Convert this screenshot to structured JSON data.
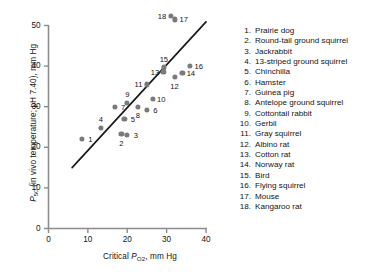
{
  "chart_data": {
    "type": "scatter",
    "title": "",
    "xlabel": "Critical P_O2, mm Hg",
    "ylabel": "P_50 (in vivo temperature; pH 7.40), mm Hg",
    "xlim": [
      0,
      40
    ],
    "ylim": [
      0,
      50
    ],
    "xticks": [
      0,
      10,
      20,
      30,
      40
    ],
    "yticks": [
      0,
      10,
      20,
      30,
      40,
      50
    ],
    "grid": false,
    "legend_position": "right",
    "x": [
      8.5,
      18.5,
      20.0,
      13.3,
      19.3,
      25.0,
      16.8,
      22.7,
      20.0,
      26.5,
      25.0,
      32.0,
      29.2,
      34.0,
      29.3,
      36.0,
      32.2,
      31.0
    ],
    "y": [
      22.0,
      23.2,
      23.0,
      24.8,
      27.0,
      29.2,
      30.0,
      30.0,
      31.0,
      32.0,
      35.5,
      37.3,
      38.5,
      38.3,
      39.7,
      40.0,
      51.5,
      52.4
    ],
    "point_labels": [
      "1",
      "2",
      "3",
      "4",
      "5",
      "6",
      "7",
      "8",
      "9",
      "10",
      "11",
      "12",
      "13",
      "14",
      "15",
      "16",
      "17",
      "18"
    ],
    "series": [
      {
        "name": "species",
        "points": [
          {
            "id": 1,
            "label": "Prairie dog",
            "x": 8.5,
            "y": 22.0,
            "label_pos": "right"
          },
          {
            "id": 2,
            "label": "Round-tail ground squirrel",
            "x": 18.5,
            "y": 23.2,
            "label_pos": "below"
          },
          {
            "id": 3,
            "label": "Jackrabbit",
            "x": 20.0,
            "y": 23.0,
            "label_pos": "right"
          },
          {
            "id": 4,
            "label": "13-striped ground squirrel",
            "x": 13.3,
            "y": 24.8,
            "label_pos": "above"
          },
          {
            "id": 5,
            "label": "Chinchilla",
            "x": 19.3,
            "y": 27.0,
            "label_pos": "right"
          },
          {
            "id": 6,
            "label": "Hamster",
            "x": 25.0,
            "y": 29.2,
            "label_pos": "right"
          },
          {
            "id": 7,
            "label": "Guinea pig",
            "x": 16.8,
            "y": 30.0,
            "label_pos": "right"
          },
          {
            "id": 8,
            "label": "Antelope ground squirrel",
            "x": 22.7,
            "y": 30.0,
            "label_pos": "below"
          },
          {
            "id": 9,
            "label": "Cottontail rabbit",
            "x": 20.0,
            "y": 31.0,
            "label_pos": "above"
          },
          {
            "id": 10,
            "label": "Gerbil",
            "x": 26.5,
            "y": 32.0,
            "label_pos": "right"
          },
          {
            "id": 11,
            "label": "Gray squirrel",
            "x": 25.0,
            "y": 35.5,
            "label_pos": "left"
          },
          {
            "id": 12,
            "label": "Albino rat",
            "x": 32.0,
            "y": 37.3,
            "label_pos": "below"
          },
          {
            "id": 13,
            "label": "Cotton rat",
            "x": 29.2,
            "y": 38.5,
            "label_pos": "left"
          },
          {
            "id": 14,
            "label": "Norway rat",
            "x": 34.0,
            "y": 38.3,
            "label_pos": "right"
          },
          {
            "id": 15,
            "label": "Bird",
            "x": 29.3,
            "y": 39.7,
            "label_pos": "above"
          },
          {
            "id": 16,
            "label": "Flying squirrel",
            "x": 36.0,
            "y": 40.0,
            "label_pos": "right"
          },
          {
            "id": 17,
            "label": "Mouse",
            "x": 32.2,
            "y": 51.5,
            "label_pos": "right"
          },
          {
            "id": 18,
            "label": "Kangaroo rat",
            "x": 31.0,
            "y": 52.4,
            "label_pos": "left"
          }
        ]
      }
    ],
    "trendline": {
      "x0": 6.0,
      "y0": 15.0,
      "x1": 40.0,
      "y1": 50.9
    },
    "marker_color": "#7a7a7a",
    "line_color": "#1a1a1a",
    "axis_color": "#8c8c8c"
  },
  "axes": {
    "x_title_main": "Critical ",
    "x_title_sym": "P",
    "x_title_sub": "O",
    "x_title_sub2": "2",
    "x_title_tail": ", mm Hg",
    "y_title_sym": "P",
    "y_title_sub": "50",
    "y_title_tail": " (in vivo temperature; pH 7.40), mm Hg",
    "xtick_labels": [
      "0",
      "10",
      "20",
      "30",
      "40"
    ],
    "ytick_labels": [
      "0",
      "10",
      "20",
      "30",
      "40",
      "50"
    ]
  },
  "legend": {
    "items": [
      {
        "num": "1.",
        "name": "Prairie dog"
      },
      {
        "num": "2.",
        "name": "Round-tail ground squirrel"
      },
      {
        "num": "3.",
        "name": "Jackrabbit"
      },
      {
        "num": "4.",
        "name": "13-striped ground squirrel"
      },
      {
        "num": "5.",
        "name": "Chinchilla"
      },
      {
        "num": "6.",
        "name": "Hamster"
      },
      {
        "num": "7.",
        "name": "Guinea pig"
      },
      {
        "num": "8.",
        "name": "Antelope ground squirrel"
      },
      {
        "num": "9.",
        "name": "Cottontail rabbit"
      },
      {
        "num": "10.",
        "name": "Gerbil"
      },
      {
        "num": "11.",
        "name": "Gray squirrel"
      },
      {
        "num": "12.",
        "name": "Albino rat"
      },
      {
        "num": "13.",
        "name": "Cotton rat"
      },
      {
        "num": "14.",
        "name": "Norway rat"
      },
      {
        "num": "15.",
        "name": "Bird"
      },
      {
        "num": "16.",
        "name": "Flying squirrel"
      },
      {
        "num": "17.",
        "name": "Mouse"
      },
      {
        "num": "18.",
        "name": "Kangaroo rat"
      }
    ]
  }
}
